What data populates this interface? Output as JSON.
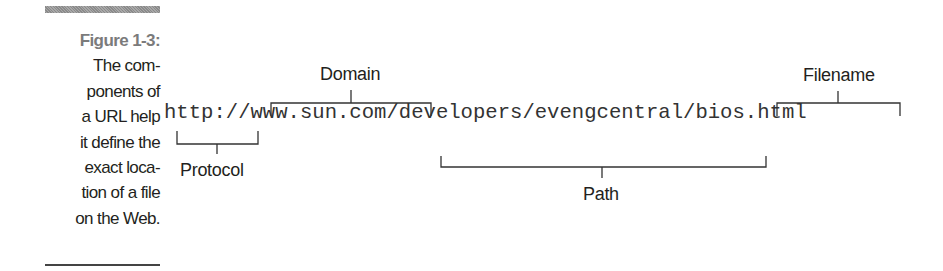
{
  "caption": {
    "figure_label": "Figure 1-3:",
    "lines": [
      "The com-",
      "ponents of",
      "a URL help",
      "it define the",
      "exact loca-",
      "tion of a file",
      "on the Web."
    ]
  },
  "diagram": {
    "url": "http://www.sun.com/developers/evengcentral/bios.html",
    "parts": {
      "protocol": "Protocol",
      "domain": "Domain",
      "path": "Path",
      "filename": "Filename"
    }
  }
}
